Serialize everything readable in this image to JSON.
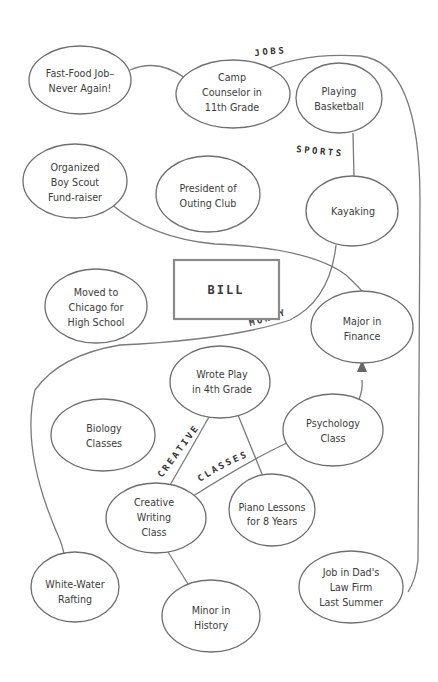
{
  "center": {
    "label": "BILL"
  },
  "category_labels": {
    "jobs": "JOBS",
    "sports": "SPORTS",
    "money": "MONEY",
    "creative": "CREATIVE",
    "classes": "CLASSES"
  },
  "nodes": {
    "fast_food": {
      "lines": [
        "Fast-Food Job–",
        "Never Again!"
      ]
    },
    "camp_counselor": {
      "lines": [
        "Camp",
        "Counselor in",
        "11th Grade"
      ]
    },
    "basketball": {
      "lines": [
        "Playing",
        "Basketball"
      ]
    },
    "boy_scout": {
      "lines": [
        "Organized",
        "Boy Scout",
        "Fund-raiser"
      ]
    },
    "outing_club": {
      "lines": [
        "President of",
        "Outing Club"
      ]
    },
    "kayaking": {
      "lines": [
        "Kayaking"
      ]
    },
    "chicago": {
      "lines": [
        "Moved to",
        "Chicago for",
        "High School"
      ]
    },
    "finance": {
      "lines": [
        "Major in",
        "Finance"
      ]
    },
    "wrote_play": {
      "lines": [
        "Wrote Play",
        "in 4th Grade"
      ]
    },
    "biology": {
      "lines": [
        "Biology",
        "Classes"
      ]
    },
    "psychology": {
      "lines": [
        "Psychology",
        "Class"
      ]
    },
    "creative_writing": {
      "lines": [
        "Creative",
        "Writing",
        "Class"
      ]
    },
    "piano": {
      "lines": [
        "Piano Lessons",
        "for 8 Years"
      ]
    },
    "rafting": {
      "lines": [
        "White-Water",
        "Rafting"
      ]
    },
    "history": {
      "lines": [
        "Minor in",
        "History"
      ]
    },
    "dads_firm": {
      "lines": [
        "Job in Dad's",
        "Law Firm",
        "Last Summer"
      ]
    }
  }
}
